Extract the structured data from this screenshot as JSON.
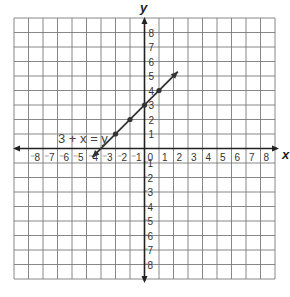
{
  "chart_data": {
    "type": "line",
    "title": "",
    "xlabel": "x",
    "ylabel": "y",
    "xlim": [
      -9,
      9
    ],
    "ylim": [
      -9,
      9
    ],
    "grid": true,
    "x_ticks": [
      "-8",
      "-7",
      "-6",
      "-5",
      "-4",
      "-3",
      "-2",
      "-1",
      "0",
      "1",
      "2",
      "3",
      "4",
      "5",
      "6",
      "7",
      "8"
    ],
    "y_ticks": [
      "8",
      "7",
      "6",
      "5",
      "4",
      "3",
      "2",
      "1",
      "-1",
      "-2",
      "-3",
      "-4",
      "-5",
      "-6",
      "-7",
      "-8"
    ],
    "series": [
      {
        "name": "3 + x = y",
        "equation": "3 + x = y",
        "points": [
          [
            -2,
            1
          ],
          [
            -1,
            2
          ],
          [
            0,
            3
          ],
          [
            1,
            4
          ]
        ],
        "line_start": [
          -3.6,
          -0.6
        ],
        "line_end": [
          2.3,
          5.3
        ],
        "arrows": "both"
      }
    ],
    "annotations": [
      {
        "text": "3 + x = y",
        "x": -6.3,
        "y": 1.1
      }
    ]
  },
  "labels": {
    "x_axis": "x",
    "y_axis": "y",
    "equation": "3 + x = y",
    "x_neg": [
      "8",
      "7",
      "6",
      "5",
      "4",
      "3",
      "2",
      "1"
    ],
    "x_pos": [
      "0",
      "1",
      "2",
      "3",
      "4",
      "5",
      "6",
      "7",
      "8"
    ],
    "y_pos": [
      "8",
      "7",
      "6",
      "5",
      "4",
      "3",
      "2",
      "1"
    ],
    "y_neg": [
      "1",
      "2",
      "3",
      "4",
      "5",
      "6",
      "7",
      "8"
    ]
  }
}
